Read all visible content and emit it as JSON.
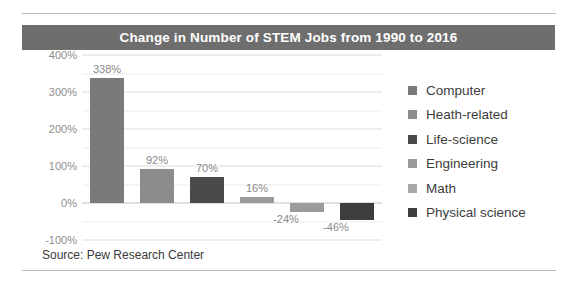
{
  "figure": {
    "title": "Change in Number of STEM Jobs from 1990 to 2016",
    "source": "Source: Pew Research Center",
    "title_band_color": "#6e6e6e",
    "title_text_color": "#ffffff",
    "background": "#ffffff"
  },
  "chart_data": {
    "type": "bar",
    "title": "Change in Number of STEM Jobs from 1990 to 2016",
    "xlabel": "",
    "ylabel": "",
    "ylim": [
      -100,
      400
    ],
    "yticks": [
      400,
      300,
      200,
      100,
      0,
      -100
    ],
    "ytick_labels": [
      "400%",
      "300%",
      "200%",
      "100%",
      "0%",
      "-100%"
    ],
    "grid": true,
    "grid_minor_step": 50,
    "legend_position": "right",
    "categories": [
      "Computer",
      "Heath-related",
      "Life-science",
      "Engineering",
      "Math",
      "Physical science"
    ],
    "values": [
      338,
      92,
      70,
      16,
      -24,
      -46
    ],
    "value_labels": [
      "338%",
      "92%",
      "70%",
      "16%",
      "-24%",
      "-46%"
    ],
    "colors": [
      "#7a7a7a",
      "#8c8c8c",
      "#4a4a4a",
      "#9b9b9b",
      "#9b9b9b",
      "#3d3d3d"
    ],
    "source": "Source: Pew Research Center"
  },
  "legend": {
    "items": [
      {
        "label": "Computer",
        "color": "#7a7a7a"
      },
      {
        "label": "Heath-related",
        "color": "#8c8c8c"
      },
      {
        "label": "Life-science",
        "color": "#4a4a4a"
      },
      {
        "label": "Engineering",
        "color": "#9b9b9b"
      },
      {
        "label": "Math",
        "color": "#a8a8a8"
      },
      {
        "label": "Physical science",
        "color": "#3d3d3d"
      }
    ]
  }
}
